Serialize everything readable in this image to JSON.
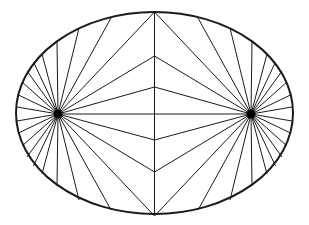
{
  "figure": {
    "title": "",
    "ellipse": {
      "cx": 154.5,
      "cy": 113,
      "rx": 138.5,
      "ry": 101
    },
    "foci": [
      {
        "x": 58,
        "y": 114
      },
      {
        "x": 251,
        "y": 114
      }
    ],
    "center_line": {
      "x": 154.5,
      "y1": 12,
      "y2": 214
    },
    "center_meet_points_y": [
      56,
      87,
      114,
      140,
      172
    ],
    "upper_left_ray_endpoints": [
      [
        17,
        107
      ],
      [
        18.5,
        95
      ],
      [
        22,
        82
      ],
      [
        27,
        71
      ],
      [
        33.5,
        62
      ],
      [
        42,
        54
      ],
      [
        57,
        42
      ],
      [
        79,
        28
      ],
      [
        111,
        18
      ],
      [
        154.5,
        12
      ]
    ],
    "colors": {
      "stroke": "#1a1a1a",
      "background": "#ffffff",
      "focus": "#000000"
    }
  }
}
